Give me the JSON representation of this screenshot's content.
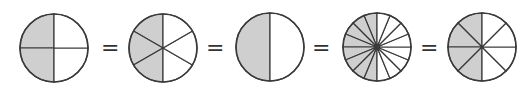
{
  "diagram": {
    "fill_color": "#cfcfcf",
    "stroke_color": "#3a3a3a",
    "equals_symbol": "=",
    "circles": [
      {
        "name": "quarters",
        "slices": 4,
        "shaded": 2,
        "fraction": "2/4"
      },
      {
        "name": "sixths",
        "slices": 6,
        "shaded": 3,
        "fraction": "3/6"
      },
      {
        "name": "halves",
        "slices": 2,
        "shaded": 1,
        "fraction": "1/2"
      },
      {
        "name": "sixteenths",
        "slices": 16,
        "shaded": 8,
        "fraction": "8/16"
      },
      {
        "name": "eighths",
        "slices": 8,
        "shaded": 4,
        "fraction": "4/8"
      }
    ]
  }
}
